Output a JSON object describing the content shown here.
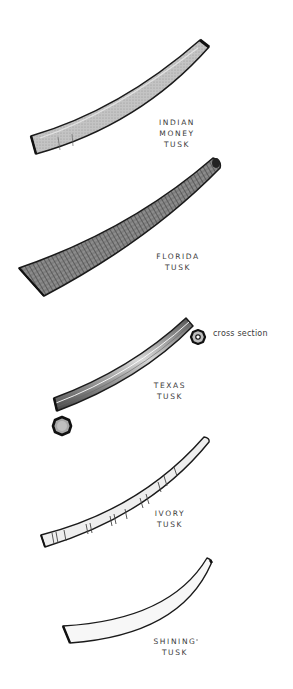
{
  "figure": {
    "tusks": [
      {
        "id": "indian-money",
        "lines": [
          "INDIAN",
          "MONEY",
          "TUSK"
        ]
      },
      {
        "id": "florida",
        "lines": [
          "FLORIDA",
          "TUSK"
        ]
      },
      {
        "id": "texas",
        "lines": [
          "TEXAS",
          "TUSK"
        ]
      },
      {
        "id": "ivory",
        "lines": [
          "IVORY",
          "TUSK"
        ]
      },
      {
        "id": "shining",
        "lines": [
          "SHINING",
          "TUSK"
        ]
      }
    ],
    "annotation": "cross section",
    "colors": {
      "outline": "#1a1a1a",
      "indian_fill": "#b8b8b8",
      "florida_fill": "#6e6e6e",
      "texas_fill": "#8a8a8a",
      "ivory_fill": "#ededed",
      "shining_fill": "#f6f6f6",
      "text": "#3a3a3a"
    }
  }
}
